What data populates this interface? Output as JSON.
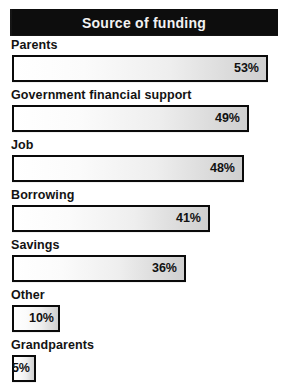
{
  "header": {
    "title": "Source of funding",
    "clipped_text_above": "",
    "background_color": "#0d0d0d",
    "text_color": "#f2f2f2"
  },
  "style": {
    "bar_border_color": "#0a0a0a",
    "bar_fill_start": "#ffffff",
    "bar_fill_end": "#cfcfcf",
    "label_color": "#131313",
    "page_background": "#ffffff"
  },
  "chart_data": {
    "type": "bar",
    "title": "Source of funding",
    "orientation": "horizontal",
    "xlabel": "",
    "ylabel": "",
    "xlim": [
      0,
      55
    ],
    "grid": false,
    "legend": null,
    "value_suffix": "%",
    "categories": [
      "Parents",
      "Government financial support",
      "Job",
      "Borrowing",
      "Savings",
      "Other",
      "Grandparents"
    ],
    "values": [
      53,
      49,
      48,
      41,
      36,
      10,
      5
    ],
    "value_labels": [
      "53%",
      "49%",
      "48%",
      "41%",
      "36%",
      "10%",
      "5%"
    ]
  },
  "rows": [
    {
      "label": "Parents",
      "value": 53,
      "value_label": "53%"
    },
    {
      "label": "Government financial support",
      "value": 49,
      "value_label": "49%"
    },
    {
      "label": "Job",
      "value": 48,
      "value_label": "48%"
    },
    {
      "label": "Borrowing",
      "value": 41,
      "value_label": "41%"
    },
    {
      "label": "Savings",
      "value": 36,
      "value_label": "36%"
    },
    {
      "label": "Other",
      "value": 10,
      "value_label": "10%"
    },
    {
      "label": "Grandparents",
      "value": 5,
      "value_label": "5%"
    }
  ]
}
